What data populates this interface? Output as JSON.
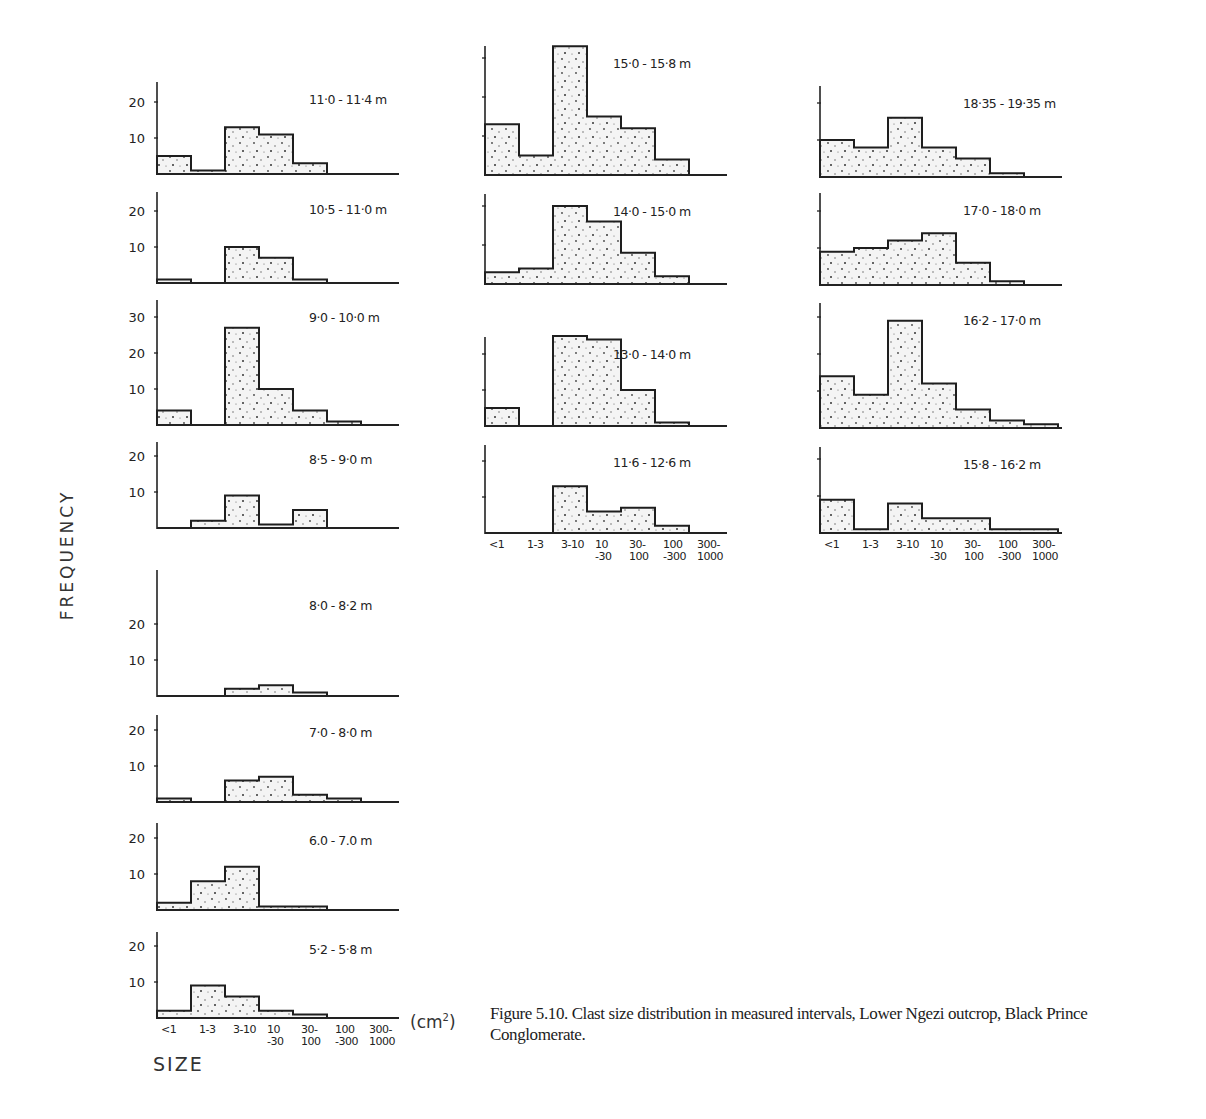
{
  "figure": {
    "caption": "Figure 5.10. Clast size distribution in measured intervals, Lower Ngezi outcrop, Black Prince Conglomerate.",
    "ylabel": "FREQUENCY",
    "xlabel": "SIZE",
    "unit": "(cm",
    "unit_sup": "2",
    "unit_close": ")"
  },
  "chart_data": {
    "type": "bar",
    "title": "Clast size distribution in measured intervals, Lower Ngezi outcrop, Black Prince Conglomerate",
    "xlabel": "SIZE (cm²)",
    "ylabel": "FREQUENCY",
    "categories": [
      "<1",
      "1-3",
      "3-10",
      "10-30",
      "30-100",
      "100-300",
      "300-1000"
    ],
    "category_labels": [
      [
        "<1",
        ""
      ],
      [
        "1-3",
        ""
      ],
      [
        "3-10",
        ""
      ],
      [
        "10",
        "-30"
      ],
      [
        "30-",
        "100"
      ],
      [
        "100",
        "-300"
      ],
      [
        "300-",
        "1000"
      ]
    ],
    "panels": [
      {
        "name": "11.0 - 11.4 m",
        "label": "11·0 - 11·4 m",
        "column": 1,
        "row": 0,
        "values": [
          5,
          1,
          13,
          11,
          3,
          0,
          0
        ],
        "yticks": [
          10,
          20
        ],
        "ymax": 25
      },
      {
        "name": "10.5 - 11.0 m",
        "label": "10·5 - 11·0 m",
        "column": 1,
        "row": 1,
        "values": [
          1,
          0,
          10,
          7,
          1,
          0,
          0
        ],
        "yticks": [
          10,
          20
        ],
        "ymax": 25
      },
      {
        "name": "9.0 - 10.0 m",
        "label": "9·0 - 10·0 m",
        "column": 1,
        "row": 2,
        "values": [
          4,
          0,
          27,
          10,
          4,
          1,
          0
        ],
        "yticks": [
          10,
          20,
          30
        ],
        "ymax": 35
      },
      {
        "name": "8.5 - 9.0 m",
        "label": "8·5 - 9·0 m",
        "column": 1,
        "row": 3,
        "values": [
          0,
          2,
          9,
          1,
          5,
          0,
          0
        ],
        "yticks": [
          10,
          20
        ],
        "ymax": 25
      },
      {
        "name": "8.0 - 8.2 m",
        "label": "8·0 - 8·2 m",
        "column": 1,
        "row": 4,
        "values": [
          0,
          0,
          2,
          3,
          1,
          0,
          0
        ],
        "yticks": [
          10,
          20
        ],
        "ymax": 35
      },
      {
        "name": "7.0 - 8.0 m",
        "label": "7·0 - 8·0 m",
        "column": 1,
        "row": 5,
        "values": [
          1,
          0,
          6,
          7,
          2,
          1,
          0
        ],
        "yticks": [
          10,
          20
        ],
        "ymax": 25
      },
      {
        "name": "6.0 - 7.0 m",
        "label": "6.0 - 7.0 m",
        "column": 1,
        "row": 6,
        "values": [
          2,
          8,
          12,
          1,
          1,
          0,
          0
        ],
        "yticks": [
          10,
          20
        ],
        "ymax": 25
      },
      {
        "name": "5.2 - 5.8 m",
        "label": "5·2 - 5·8 m",
        "column": 1,
        "row": 7,
        "values": [
          2,
          9,
          6,
          2,
          1,
          0,
          0
        ],
        "yticks": [
          10,
          20
        ],
        "ymax": 25
      },
      {
        "name": "15.0 - 15.8 m",
        "label": "15·0 - 15·8 m",
        "column": 2,
        "row": 0,
        "values": [
          13,
          5,
          33,
          15,
          12,
          4,
          0
        ],
        "yticks": [
          10,
          20,
          30
        ],
        "ymax": 34
      },
      {
        "name": "14.0 - 15.0 m",
        "label": "14·0 - 15·0 m",
        "column": 2,
        "row": 1,
        "values": [
          3,
          4,
          20,
          16,
          8,
          2,
          0
        ],
        "yticks": [
          10,
          20
        ],
        "ymax": 25
      },
      {
        "name": "13.0 - 14.0 m",
        "label": "13·0 - 14·0 m",
        "column": 2,
        "row": 2,
        "values": [
          5,
          0,
          25,
          24,
          10,
          1,
          0
        ],
        "yticks": [
          10,
          20
        ],
        "ymax": 30
      },
      {
        "name": "11.6 - 12.6 m",
        "label": "11·6 - 12·6 m",
        "column": 2,
        "row": 3,
        "values": [
          0,
          0,
          13,
          6,
          7,
          2,
          0
        ],
        "yticks": [
          10,
          20
        ],
        "ymax": 25
      },
      {
        "name": "18.35 - 19.35 m",
        "label": "18·35 - 19·35 m",
        "column": 3,
        "row": 0,
        "values": [
          10,
          8,
          16,
          8,
          5,
          1,
          0
        ],
        "yticks": [
          10,
          20
        ],
        "ymax": 25
      },
      {
        "name": "17.0 - 18.0 m",
        "label": "17·0 - 18·0 m",
        "column": 3,
        "row": 1,
        "values": [
          9,
          10,
          12,
          14,
          6,
          1,
          0
        ],
        "yticks": [
          10,
          20
        ],
        "ymax": 25
      },
      {
        "name": "16.2 - 17.0 m",
        "label": "16·2 - 17·0 m",
        "column": 3,
        "row": 2,
        "values": [
          14,
          9,
          29,
          12,
          5,
          2,
          1
        ],
        "yticks": [
          10,
          20,
          30
        ],
        "ymax": 35
      },
      {
        "name": "15.8 - 16.2 m",
        "label": "15·8 - 16·2 m",
        "column": 3,
        "row": 3,
        "values": [
          9,
          1,
          8,
          4,
          4,
          1,
          1
        ],
        "yticks": [
          10,
          20
        ],
        "ymax": 25
      }
    ],
    "grid": false,
    "legend": null
  }
}
